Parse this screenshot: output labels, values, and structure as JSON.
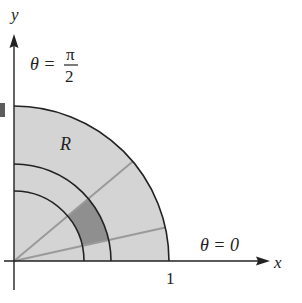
{
  "diagram": {
    "labels": {
      "y_axis": "y",
      "x_axis": "x",
      "theta_pi_over_2_lhs": "θ =",
      "theta_pi_over_2_num": "π",
      "theta_pi_over_2_den": "2",
      "theta_zero": "θ = 0",
      "region": "R",
      "tick_one": "1"
    },
    "geometry": {
      "outer_radius": 1,
      "inner_arcs": [
        "r1",
        "r2"
      ],
      "rays": [
        "θ1",
        "θ2"
      ],
      "shaded_polar_rectangle": "r1 ≤ r ≤ r2, θ1 ≤ θ ≤ θ2"
    },
    "colors": {
      "region_fill": "#d4d4d4",
      "polar_rect_fill": "#8f8f8f",
      "arc_stroke": "#222222",
      "ray_stroke": "#9a9a9a",
      "axis_stroke": "#222222"
    }
  }
}
